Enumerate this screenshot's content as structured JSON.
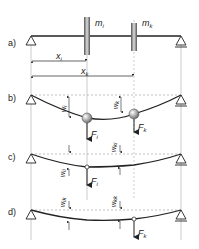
{
  "panels": [
    {
      "id": "a",
      "label": "a)",
      "masses": [
        {
          "name": "m",
          "sub": "i"
        },
        {
          "name": "m",
          "sub": "k"
        }
      ],
      "distances": [
        {
          "name": "x",
          "sub": "i"
        },
        {
          "name": "x",
          "sub": "k"
        }
      ]
    },
    {
      "id": "b",
      "label": "b)",
      "deflections": [
        {
          "name": "w",
          "sub": "i"
        },
        {
          "name": "w",
          "sub": "k"
        }
      ],
      "forces": [
        {
          "name": "F",
          "sub": "i"
        },
        {
          "name": "F",
          "sub": "k"
        }
      ]
    },
    {
      "id": "c",
      "label": "c)",
      "deflections": [
        {
          "name": "w",
          "sub": "ii"
        },
        {
          "name": "w",
          "sub": "ki"
        }
      ],
      "forces": [
        {
          "name": "F",
          "sub": "i"
        }
      ]
    },
    {
      "id": "d",
      "label": "d)",
      "deflections": [
        {
          "name": "w",
          "sub": "ik"
        },
        {
          "name": "w",
          "sub": "kk"
        }
      ],
      "forces": [
        {
          "name": "F",
          "sub": "k"
        }
      ]
    }
  ],
  "colors": {
    "line": "#222222",
    "guide": "#999999",
    "disk": "#777777"
  }
}
